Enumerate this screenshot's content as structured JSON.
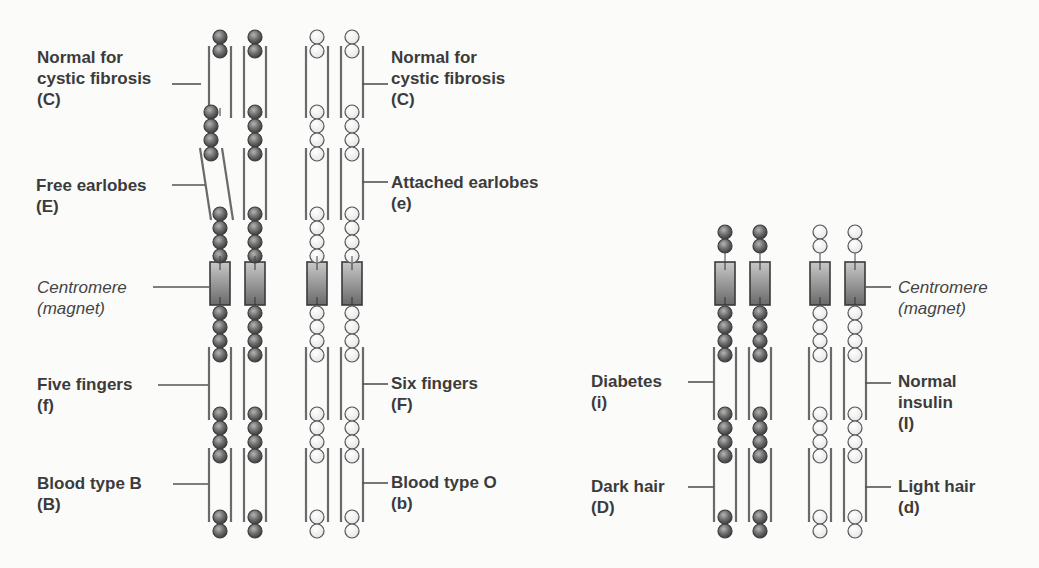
{
  "figure": {
    "colors": {
      "dominant_bead_fill": "#6e6e6e",
      "dominant_bead_stroke": "#3c3c3c",
      "recessive_bead_fill": "#f2f2f2",
      "recessive_bead_stroke": "#555555",
      "sleeve_stroke": "#6a6a6a",
      "centromere_fill": "#8a8a8a",
      "centromere_stroke": "#3a3a3a",
      "text": "#3b3b3b",
      "leader_line": "#555555",
      "background": "#fbfbfa"
    }
  },
  "left_group": {
    "labels_left": [
      {
        "line1": "Normal for",
        "line2": "cystic fibrosis",
        "line3": "(C)"
      },
      {
        "line1": "Free earlobes",
        "line2": "(E)"
      },
      {
        "line1": "Centromere",
        "line2": "(magnet)"
      },
      {
        "line1": "Five fingers",
        "line2": "(f)"
      },
      {
        "line1": "Blood type B",
        "line2": "(B)"
      }
    ],
    "labels_right": [
      {
        "line1": "Normal for",
        "line2": "cystic fibrosis",
        "line3": "(C)"
      },
      {
        "line1": "Attached earlobes",
        "line2": "(e)"
      },
      {
        "line1": "Six fingers",
        "line2": "(F)"
      },
      {
        "line1": "Blood type O",
        "line2": "(b)"
      }
    ]
  },
  "right_group": {
    "labels_left": [
      {
        "line1": "Diabetes",
        "line2": "(i)"
      },
      {
        "line1": "Dark hair",
        "line2": "(D)"
      }
    ],
    "labels_right": [
      {
        "line1": "Centromere",
        "line2": "(magnet)"
      },
      {
        "line1": "Normal",
        "line2": "insulin",
        "line3": "(I)"
      },
      {
        "line1": "Light hair",
        "line2": "(d)"
      }
    ]
  }
}
